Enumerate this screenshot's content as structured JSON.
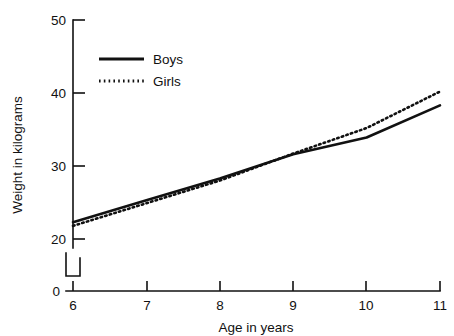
{
  "chart_data": {
    "type": "line",
    "title": "",
    "xlabel": "Age in years",
    "ylabel": "Weight in kilograms",
    "x": [
      6,
      7,
      8,
      9,
      10,
      11
    ],
    "xticklabels": [
      "6",
      "7",
      "8",
      "9",
      "10",
      "11"
    ],
    "yticklabels": [
      "0",
      "20",
      "30",
      "40",
      "50"
    ],
    "yticks": [
      0,
      20,
      30,
      40,
      50
    ],
    "xlim": [
      6,
      11
    ],
    "ylim": [
      20,
      50
    ],
    "axis_break": true,
    "axis_break_note": "y-axis broken between 0 and 20",
    "grid": false,
    "legend_position": "upper-left-center",
    "series": [
      {
        "name": "Boys",
        "style": "solid",
        "color": "#111111",
        "values": [
          22.3,
          25.3,
          28.3,
          31.6,
          33.9,
          38.3
        ]
      },
      {
        "name": "Girls",
        "style": "dotted",
        "color": "#111111",
        "values": [
          21.8,
          24.9,
          28.0,
          31.7,
          35.2,
          40.2
        ]
      }
    ]
  },
  "legend": {
    "entries": [
      {
        "label": "Boys"
      },
      {
        "label": "Girls"
      }
    ]
  },
  "axes": {
    "x_title": "Age in years",
    "y_title": "Weight in kilograms",
    "x_ticks": [
      "6",
      "7",
      "8",
      "9",
      "10",
      "11"
    ],
    "y_ticks": [
      "50",
      "40",
      "30",
      "20",
      "0"
    ]
  }
}
